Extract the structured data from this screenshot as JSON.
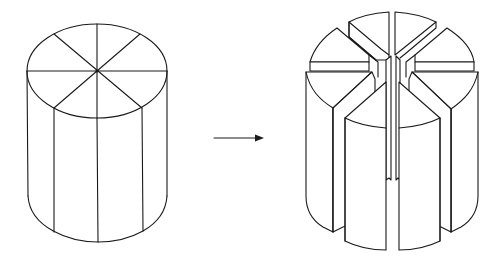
{
  "diagram": {
    "description": "Cylinder divided into eight sectors transformed into separated wedge segments",
    "left_figure": {
      "name": "whole cylinder",
      "top_divisions": 8,
      "visible_side_lines": 3
    },
    "arrow": {
      "direction": "right"
    },
    "right_figure": {
      "name": "cylinder split into eight wedges",
      "wedge_count": 8
    },
    "colors": {
      "stroke": "#1a1a1a",
      "background": "#ffffff"
    }
  }
}
